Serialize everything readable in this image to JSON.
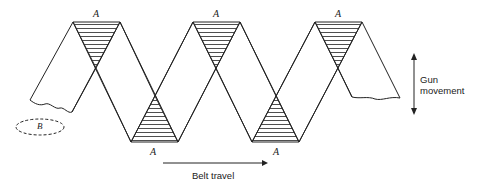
{
  "diagram": {
    "labels": {
      "overlap": "A",
      "gap": "B",
      "belt_travel": "Belt travel",
      "gun_movement_line1": "Gun",
      "gun_movement_line2": "movement"
    },
    "colors": {
      "line": "#222222",
      "background": "#ffffff"
    }
  }
}
